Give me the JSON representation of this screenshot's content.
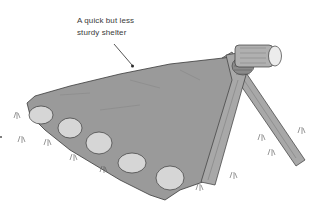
{
  "illustration": {
    "subject": "Tarp lean-to shelter weighted with stones and supported by crossed poles",
    "annotation": {
      "line1": "A quick but less",
      "line2": "sturdy shelter"
    },
    "colors": {
      "tarp": "#9a9a9a",
      "stone": "#d6d6d6",
      "wood": "#a8a8a8",
      "outline": "#3a3a3a",
      "background": "#ffffff"
    }
  }
}
